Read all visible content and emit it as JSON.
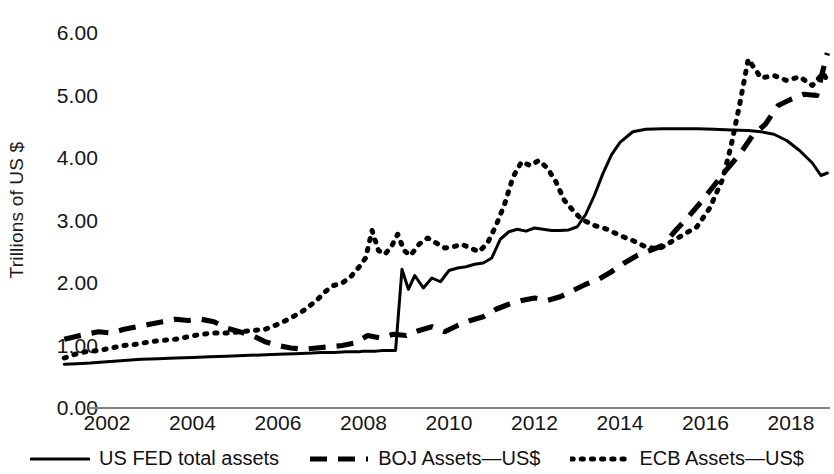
{
  "chart_data": {
    "type": "line",
    "title": "",
    "xlabel": "",
    "ylabel": "Trillions of US $",
    "xlim": [
      2001.0,
      2018.9
    ],
    "ylim": [
      0.0,
      6.4
    ],
    "grid": false,
    "legend_position": "bottom",
    "y_ticks": [
      "0.00",
      "1.00",
      "2.00",
      "3.00",
      "4.00",
      "5.00",
      "6.00"
    ],
    "y_tick_values": [
      0,
      1,
      2,
      3,
      4,
      5,
      6
    ],
    "x_ticks": [
      "2002",
      "2004",
      "2006",
      "2008",
      "2010",
      "2012",
      "2014",
      "2016",
      "2018"
    ],
    "x_tick_values": [
      2002,
      2004,
      2006,
      2008,
      2010,
      2012,
      2014,
      2016,
      2018
    ],
    "series": [
      {
        "name": "US FED total assets",
        "style": "solid",
        "color": "#000000",
        "x": [
          2001.0,
          2001.3,
          2001.6,
          2002.0,
          2002.4,
          2002.8,
          2003.2,
          2003.6,
          2004.0,
          2004.4,
          2004.8,
          2005.2,
          2005.6,
          2006.0,
          2006.4,
          2006.8,
          2007.0,
          2007.3,
          2007.6,
          2007.8,
          2007.9,
          2008.0,
          2008.1,
          2008.2,
          2008.3,
          2008.45,
          2008.6,
          2008.75,
          2008.9,
          2009.05,
          2009.2,
          2009.4,
          2009.6,
          2009.8,
          2010.0,
          2010.2,
          2010.4,
          2010.6,
          2010.8,
          2011.0,
          2011.2,
          2011.4,
          2011.6,
          2011.8,
          2012.0,
          2012.2,
          2012.4,
          2012.6,
          2012.8,
          2013.0,
          2013.2,
          2013.4,
          2013.6,
          2013.8,
          2014.0,
          2014.3,
          2014.6,
          2015.0,
          2015.4,
          2015.8,
          2016.2,
          2016.6,
          2017.0,
          2017.3,
          2017.6,
          2017.9,
          2018.2,
          2018.5,
          2018.7,
          2018.85
        ],
        "y": [
          0.7,
          0.71,
          0.72,
          0.74,
          0.76,
          0.78,
          0.79,
          0.8,
          0.81,
          0.82,
          0.83,
          0.84,
          0.85,
          0.86,
          0.87,
          0.88,
          0.89,
          0.89,
          0.9,
          0.9,
          0.9,
          0.91,
          0.91,
          0.91,
          0.91,
          0.92,
          0.92,
          0.92,
          2.22,
          1.9,
          2.12,
          1.92,
          2.08,
          2.02,
          2.2,
          2.24,
          2.26,
          2.3,
          2.32,
          2.4,
          2.7,
          2.82,
          2.86,
          2.83,
          2.88,
          2.86,
          2.84,
          2.84,
          2.85,
          2.9,
          3.1,
          3.4,
          3.75,
          4.05,
          4.25,
          4.42,
          4.46,
          4.47,
          4.47,
          4.47,
          4.46,
          4.45,
          4.44,
          4.42,
          4.38,
          4.28,
          4.12,
          3.92,
          3.72,
          3.76
        ]
      },
      {
        "name": "BOJ Assets—US$",
        "style": "dashed",
        "color": "#000000",
        "x": [
          2001.0,
          2001.25,
          2001.5,
          2001.8,
          2002.1,
          2002.4,
          2002.7,
          2003.0,
          2003.3,
          2003.6,
          2003.9,
          2004.2,
          2004.5,
          2004.8,
          2005.1,
          2005.4,
          2005.7,
          2006.0,
          2006.3,
          2006.6,
          2006.9,
          2007.2,
          2007.5,
          2007.8,
          2008.1,
          2008.4,
          2008.7,
          2009.0,
          2009.3,
          2009.6,
          2009.9,
          2010.2,
          2010.5,
          2010.8,
          2011.1,
          2011.4,
          2011.7,
          2012.0,
          2012.3,
          2012.6,
          2012.9,
          2013.2,
          2013.5,
          2013.8,
          2014.1,
          2014.4,
          2014.7,
          2015.0,
          2015.3,
          2015.6,
          2015.9,
          2016.2,
          2016.5,
          2016.8,
          2017.1,
          2017.4,
          2017.7,
          2018.0,
          2018.3,
          2018.6,
          2018.85
        ],
        "y": [
          1.1,
          1.14,
          1.18,
          1.22,
          1.2,
          1.26,
          1.3,
          1.34,
          1.38,
          1.42,
          1.4,
          1.42,
          1.38,
          1.28,
          1.22,
          1.16,
          1.06,
          1.0,
          0.96,
          0.94,
          0.96,
          0.98,
          1.0,
          1.04,
          1.16,
          1.12,
          1.18,
          1.16,
          1.24,
          1.3,
          1.22,
          1.32,
          1.4,
          1.46,
          1.58,
          1.66,
          1.72,
          1.76,
          1.72,
          1.78,
          1.88,
          1.98,
          2.06,
          2.18,
          2.32,
          2.44,
          2.52,
          2.6,
          2.84,
          3.06,
          3.3,
          3.56,
          3.82,
          4.06,
          4.36,
          4.54,
          4.84,
          4.94,
          5.02,
          5.0,
          5.68
        ]
      },
      {
        "name": "ECB Assets—US$",
        "style": "dotted",
        "color": "#000000",
        "x": [
          2001.0,
          2001.25,
          2001.5,
          2001.8,
          2002.1,
          2002.4,
          2002.7,
          2003.0,
          2003.3,
          2003.6,
          2003.9,
          2004.2,
          2004.5,
          2004.8,
          2005.1,
          2005.4,
          2005.7,
          2006.0,
          2006.3,
          2006.6,
          2006.9,
          2007.1,
          2007.3,
          2007.5,
          2007.7,
          2007.9,
          2008.05,
          2008.2,
          2008.35,
          2008.5,
          2008.65,
          2008.8,
          2008.95,
          2009.1,
          2009.3,
          2009.5,
          2009.7,
          2009.9,
          2010.1,
          2010.3,
          2010.5,
          2010.7,
          2010.9,
          2011.1,
          2011.3,
          2011.5,
          2011.7,
          2011.9,
          2012.1,
          2012.3,
          2012.5,
          2012.7,
          2012.9,
          2013.1,
          2013.4,
          2013.7,
          2014.0,
          2014.3,
          2014.6,
          2014.9,
          2015.2,
          2015.5,
          2015.8,
          2016.1,
          2016.4,
          2016.6,
          2016.8,
          2017.0,
          2017.3,
          2017.6,
          2017.9,
          2018.2,
          2018.5,
          2018.75,
          2018.85
        ],
        "y": [
          0.8,
          0.86,
          0.9,
          0.92,
          0.96,
          1.0,
          1.02,
          1.06,
          1.08,
          1.1,
          1.14,
          1.18,
          1.2,
          1.2,
          1.22,
          1.24,
          1.26,
          1.34,
          1.44,
          1.56,
          1.72,
          1.86,
          1.96,
          2.0,
          2.1,
          2.26,
          2.4,
          2.84,
          2.52,
          2.46,
          2.58,
          2.78,
          2.52,
          2.44,
          2.62,
          2.72,
          2.64,
          2.56,
          2.58,
          2.62,
          2.56,
          2.5,
          2.64,
          2.92,
          3.26,
          3.7,
          3.94,
          3.88,
          3.96,
          3.84,
          3.62,
          3.32,
          3.16,
          3.02,
          2.92,
          2.86,
          2.76,
          2.68,
          2.58,
          2.54,
          2.66,
          2.78,
          2.9,
          3.2,
          3.66,
          4.2,
          4.86,
          5.58,
          5.28,
          5.32,
          5.24,
          5.3,
          5.16,
          5.36,
          5.24
        ]
      }
    ]
  },
  "axis": {
    "y_title": "Trillions of US $"
  },
  "legend": {
    "items": [
      {
        "label": "US FED total assets",
        "style": "solid"
      },
      {
        "label": "BOJ Assets—US$",
        "style": "dashed"
      },
      {
        "label": "ECB Assets—US$",
        "style": "dotted"
      }
    ]
  }
}
